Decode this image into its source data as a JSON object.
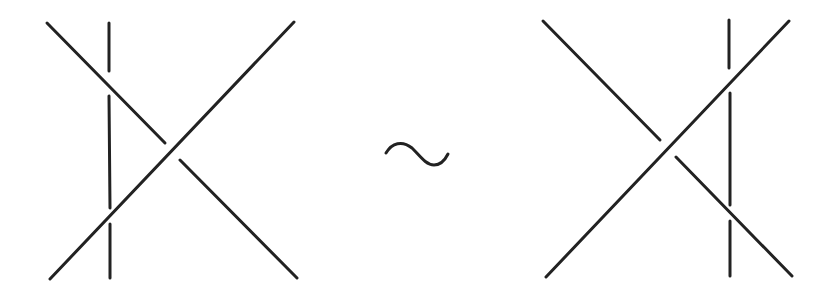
{
  "diagram": {
    "stroke_color": "#222222",
    "background": "#ffffff",
    "relation_symbol": "~",
    "left_tangle": {
      "description": "Three strands; vertical strand passes under both diagonals, left of the crossing",
      "vertical_x": 109,
      "vertical_segments": [
        [
          23,
          71
        ],
        [
          96,
          208
        ],
        [
          224,
          278
        ]
      ],
      "over_diagonal": [
        [
          50,
          279
        ],
        [
          294,
          22
        ]
      ],
      "under_diagonal_segments": [
        [
          [
            47,
            23
          ],
          [
            165,
            143
          ]
        ],
        [
          [
            180,
            160
          ],
          [
            297,
            278
          ]
        ]
      ]
    },
    "right_tangle": {
      "description": "Three strands; vertical strand passes under both diagonals, right of the crossing",
      "vertical_x": 730,
      "vertical_segments": [
        [
          20,
          68
        ],
        [
          93,
          205
        ],
        [
          221,
          276
        ]
      ],
      "over_diagonal": [
        [
          546,
          277
        ],
        [
          789,
          21
        ]
      ],
      "under_diagonal_segments": [
        [
          [
            543,
            21
          ],
          [
            660,
            140
          ]
        ],
        [
          [
            676,
            157
          ],
          [
            792,
            276
          ]
        ]
      ]
    }
  }
}
